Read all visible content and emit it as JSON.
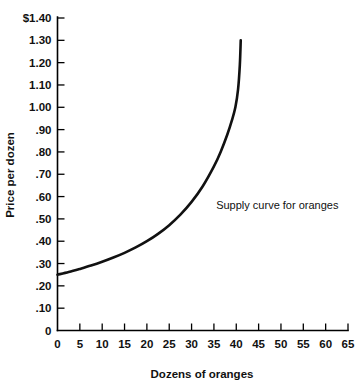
{
  "chart_data": {
    "type": "line",
    "title": "",
    "xlabel": "Dozens of oranges",
    "ylabel": "Price per dozen",
    "xlim": [
      0,
      65
    ],
    "ylim": [
      0,
      1.4
    ],
    "grid": false,
    "legend": "none",
    "xticklabels": [
      "0",
      "5",
      "10",
      "15",
      "20",
      "25",
      "30",
      "35",
      "40",
      "45",
      "50",
      "55",
      "60",
      "65"
    ],
    "xtickvalues": [
      0,
      5,
      10,
      15,
      20,
      25,
      30,
      35,
      40,
      45,
      50,
      55,
      60,
      65
    ],
    "yticklabels": [
      "0",
      ".10",
      ".20",
      ".30",
      ".40",
      ".50",
      ".60",
      ".70",
      ".80",
      ".90",
      "1.00",
      "1.10",
      "1.20",
      "1.30",
      "$1.40"
    ],
    "ytickvalues": [
      0,
      0.1,
      0.2,
      0.3,
      0.4,
      0.5,
      0.6,
      0.7,
      0.8,
      0.9,
      1.0,
      1.1,
      1.2,
      1.3,
      1.4
    ],
    "annotations": [
      {
        "text": "Supply curve for oranges",
        "x": 35.5,
        "y": 0.545
      }
    ],
    "series": [
      {
        "name": "Supply curve for oranges",
        "color": "#111111",
        "x": [
          0,
          2.5,
          5,
          7.5,
          10,
          12.5,
          15,
          17.5,
          20,
          22.5,
          25,
          27.5,
          30,
          32.5,
          35,
          36.5,
          38,
          39,
          39.8,
          40.4,
          40.8,
          41
        ],
        "y": [
          0.25,
          0.262,
          0.276,
          0.291,
          0.308,
          0.327,
          0.348,
          0.372,
          0.4,
          0.433,
          0.472,
          0.519,
          0.576,
          0.646,
          0.735,
          0.8,
          0.878,
          0.94,
          1.0,
          1.08,
          1.19,
          1.3
        ]
      }
    ]
  }
}
